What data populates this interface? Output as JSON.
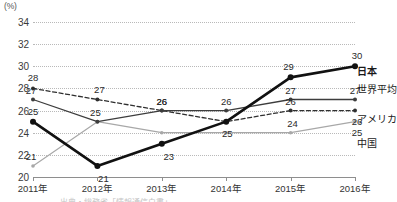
{
  "chart_data": {
    "type": "line",
    "title": "",
    "xlabel": "",
    "ylabel": "(%)",
    "unit_label": "(%)",
    "categories": [
      "2011年",
      "2012年",
      "2013年",
      "2014年",
      "2015年",
      "2016年"
    ],
    "x": [
      2011,
      2012,
      2013,
      2014,
      2015,
      2016
    ],
    "ylim": [
      20,
      34
    ],
    "yticks": [
      20,
      22,
      24,
      26,
      28,
      30,
      32,
      34
    ],
    "grid": true,
    "legend_position": "right",
    "series": [
      {
        "name": "日本",
        "style": "thick-solid-black",
        "color": "#111111",
        "values": [
          25,
          21,
          23,
          25,
          29,
          30
        ],
        "labels": [
          "25",
          "21",
          "23",
          "",
          "29",
          "30"
        ]
      },
      {
        "name": "世界平均",
        "style": "solid-dark",
        "color": "#3d3d3d",
        "values": [
          27,
          25,
          26,
          26,
          27,
          27
        ],
        "labels": [
          "27",
          "25",
          "26",
          "26",
          "27",
          "27"
        ]
      },
      {
        "name": "アメリカ",
        "style": "dashed",
        "color": "#2f2f2f",
        "values": [
          28,
          27,
          26,
          25,
          26,
          26
        ],
        "labels": [
          "28",
          "27",
          "26",
          "25",
          "26",
          "26"
        ]
      },
      {
        "name": "中国",
        "style": "solid-light-gray",
        "color": "#a8a8a8",
        "values": [
          21,
          25,
          24,
          24,
          24,
          25
        ],
        "labels": [
          "21",
          "",
          "",
          "",
          "24",
          "25"
        ]
      }
    ],
    "right_labels": [
      {
        "text": "日本",
        "value": 30,
        "bold": true
      },
      {
        "text": "世界平均",
        "value": 27,
        "bold": false
      },
      {
        "text": "アメリカ",
        "value": 26,
        "bold": false
      },
      {
        "text": "中国",
        "value": 25,
        "bold": false
      }
    ],
    "bottom_caption": "出典・総務省「情報通信白書」"
  }
}
